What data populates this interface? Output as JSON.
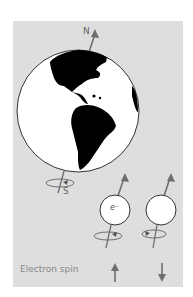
{
  "figure": {
    "background_color": "#ffffff",
    "panel_color": "#dedede",
    "ink_color": "#777777",
    "globe": {
      "north_label": "N",
      "south_label": "S",
      "land_color": "#000000",
      "ocean_color": "#ffffff"
    },
    "electrons": [
      {
        "symbol": "e⁻",
        "spin": "up"
      },
      {
        "symbol": "",
        "spin": "down"
      }
    ],
    "caption": "Electron spin",
    "spin_arrows": [
      "↑",
      "↓"
    ]
  }
}
